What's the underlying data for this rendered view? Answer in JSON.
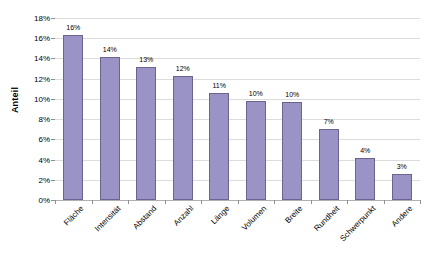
{
  "chart_data": {
    "type": "bar",
    "title": "",
    "subtitle": "",
    "xlabel": "",
    "ylabel": "Anteil",
    "ylim": [
      0,
      18
    ],
    "y_tick_labels": [
      "18%",
      "16%",
      "14%",
      "12%",
      "10%",
      "8%",
      "6%",
      "4%",
      "2%",
      "0%"
    ],
    "y_tick_values": [
      18,
      16,
      14,
      12,
      10,
      8,
      6,
      4,
      2,
      0
    ],
    "grid": true,
    "legend": false,
    "categories": [
      "Fläche",
      "Intensität",
      "Abstand",
      "Anzahl",
      "Länge",
      "Volumen",
      "Breite",
      "Rundheit",
      "Schwerpunkt",
      "Andere"
    ],
    "values": [
      16.3,
      14.1,
      13.2,
      12.3,
      10.6,
      9.8,
      9.7,
      7.0,
      4.2,
      2.6
    ],
    "data_labels": [
      "16%",
      "14%",
      "13%",
      "12%",
      "11%",
      "10%",
      "10%",
      "7%",
      "4%",
      "3%"
    ],
    "bar_fill_color": "#9a93c6",
    "bar_border_color": "#6b6490",
    "gridline_color": "#dcdcdc",
    "axis_color": "#b0b0b0",
    "background_color": "#ffffff"
  }
}
